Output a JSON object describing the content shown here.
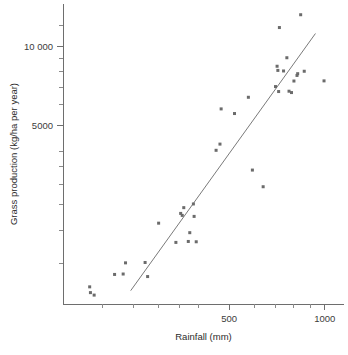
{
  "chart_data": {
    "type": "scatter",
    "title": "",
    "xlabel": "Rainfall (mm)",
    "ylabel": "Grass production (kg/ha per year)",
    "xscale": "log",
    "yscale": "log",
    "xlim": [
      150,
      1150
    ],
    "ylim": [
      1050,
      14500
    ],
    "grid": false,
    "legend": "none",
    "x_tick_labels": [
      "500",
      "1000"
    ],
    "x_labeled_ticks": [
      500,
      1000
    ],
    "x_minor_ticks": [
      200,
      250,
      300,
      350,
      400,
      600,
      700,
      800,
      900
    ],
    "y_tick_labels": [
      "5000",
      "10 000"
    ],
    "y_labeled_ticks": [
      5000,
      10000
    ],
    "y_minor_ticks": [
      1500,
      2000,
      2500,
      3000,
      3500,
      4000,
      6000,
      7000,
      8000,
      9000,
      12000
    ],
    "marker_color": "#6b6b6b",
    "marker_shape": "square",
    "marker_size_px": 3,
    "fit_line": {
      "type": "linear-on-log-log",
      "color": "#7a7a7a",
      "x_start": 245,
      "y_start": 1180,
      "x_end": 935,
      "y_end": 11200
    },
    "points": [
      {
        "x": 182,
        "y": 1220
      },
      {
        "x": 183,
        "y": 1160
      },
      {
        "x": 188,
        "y": 1135
      },
      {
        "x": 218,
        "y": 1360
      },
      {
        "x": 232,
        "y": 1365
      },
      {
        "x": 236,
        "y": 1505
      },
      {
        "x": 272,
        "y": 1510
      },
      {
        "x": 277,
        "y": 1335
      },
      {
        "x": 300,
        "y": 2130
      },
      {
        "x": 340,
        "y": 1800
      },
      {
        "x": 352,
        "y": 2320
      },
      {
        "x": 356,
        "y": 2280
      },
      {
        "x": 360,
        "y": 2440
      },
      {
        "x": 372,
        "y": 1815
      },
      {
        "x": 376,
        "y": 1960
      },
      {
        "x": 386,
        "y": 2520
      },
      {
        "x": 388,
        "y": 2260
      },
      {
        "x": 394,
        "y": 1810
      },
      {
        "x": 455,
        "y": 4030
      },
      {
        "x": 468,
        "y": 4255
      },
      {
        "x": 472,
        "y": 5790
      },
      {
        "x": 520,
        "y": 5560
      },
      {
        "x": 575,
        "y": 6410
      },
      {
        "x": 592,
        "y": 3390
      },
      {
        "x": 640,
        "y": 2930
      },
      {
        "x": 700,
        "y": 7040
      },
      {
        "x": 708,
        "y": 8410
      },
      {
        "x": 712,
        "y": 8110
      },
      {
        "x": 716,
        "y": 6740
      },
      {
        "x": 720,
        "y": 11800
      },
      {
        "x": 742,
        "y": 8070
      },
      {
        "x": 760,
        "y": 9060
      },
      {
        "x": 772,
        "y": 6760
      },
      {
        "x": 786,
        "y": 6680
      },
      {
        "x": 800,
        "y": 7390
      },
      {
        "x": 818,
        "y": 7760
      },
      {
        "x": 822,
        "y": 7880
      },
      {
        "x": 840,
        "y": 13200
      },
      {
        "x": 862,
        "y": 8050
      },
      {
        "x": 995,
        "y": 7400
      }
    ]
  }
}
